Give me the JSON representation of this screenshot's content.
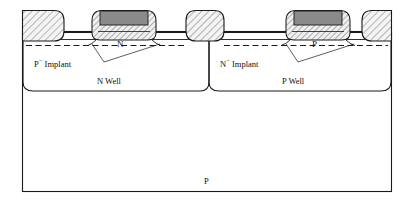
{
  "figure": {
    "type": "semiconductor-cross-section",
    "background_color": "#ffffff",
    "outline_color": "#1a1a1a"
  },
  "colors": {
    "gate_fill": "#8a8a8a",
    "hatch_fill": "#f2f2f2",
    "hatch_line": "#4a4a4a",
    "outline": "#1a1a1a",
    "dashed_line": "#1a1a1a",
    "substrate_fill": "#ffffff",
    "text": "#111111"
  },
  "labels": {
    "p_implant": "P",
    "p_implant_sup": "−",
    "p_implant_word": " Implant",
    "n_implant": "N",
    "n_implant_sup": "−",
    "n_implant_word": " Implant",
    "n_well": "N Well",
    "p_well": "P Well",
    "substrate": "P",
    "n_channel": "N",
    "p_channel": "P"
  },
  "regions": [
    {
      "name": "n-well",
      "label": "N Well",
      "side": "left"
    },
    {
      "name": "p-well",
      "label": "P Well",
      "side": "right"
    },
    {
      "name": "substrate",
      "label": "P",
      "side": "bottom"
    }
  ],
  "isolation_blocks": [
    {
      "name": "sti-left",
      "x": 22,
      "width": 42,
      "fill": "hatched"
    },
    {
      "name": "sti-center",
      "x": 186,
      "width": 38,
      "fill": "hatched"
    },
    {
      "name": "sti-right",
      "x": 362,
      "width": 40,
      "fill": "hatched"
    }
  ],
  "gates": [
    {
      "name": "nmos-gate",
      "x": 92,
      "width": 64,
      "poly_fill": "#8a8a8a",
      "channel_label": "N"
    },
    {
      "name": "pmos-gate",
      "x": 286,
      "width": 64,
      "poly_fill": "#8a8a8a",
      "channel_label": "P"
    }
  ]
}
